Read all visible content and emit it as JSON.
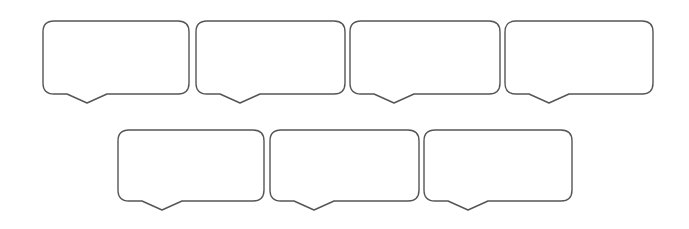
{
  "diagram": {
    "type": "speech-bubble-grid",
    "stroke_color": "#555555",
    "fill_color": "#ffffff",
    "background": "#ffffff",
    "corner_radius": 11,
    "tail": {
      "offset_from_left": 24,
      "width": 40,
      "depth": 9
    },
    "rows": [
      {
        "bubbles": [
          {
            "x": 43,
            "y": 21,
            "w": 146,
            "h": 73,
            "label": ""
          },
          {
            "x": 196,
            "y": 21,
            "w": 149,
            "h": 73,
            "label": ""
          },
          {
            "x": 350,
            "y": 21,
            "w": 150,
            "h": 73,
            "label": ""
          },
          {
            "x": 505,
            "y": 21,
            "w": 148,
            "h": 73,
            "label": ""
          }
        ]
      },
      {
        "bubbles": [
          {
            "x": 118,
            "y": 130,
            "w": 146,
            "h": 71,
            "label": ""
          },
          {
            "x": 270,
            "y": 130,
            "w": 149,
            "h": 71,
            "label": ""
          },
          {
            "x": 424,
            "y": 130,
            "w": 148,
            "h": 71,
            "label": ""
          }
        ]
      }
    ]
  }
}
